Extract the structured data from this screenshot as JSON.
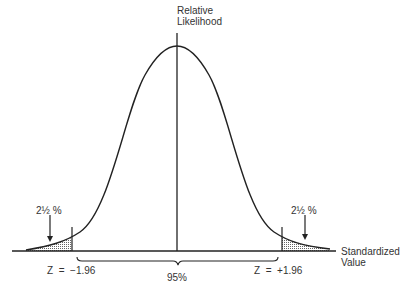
{
  "diagram": {
    "y_axis_label_line1": "Relative",
    "y_axis_label_line2": "Likelihood",
    "x_axis_label_line1": "Standardized",
    "x_axis_label_line2": "Value",
    "left_tail_label": "2½ %",
    "right_tail_label": "2½ %",
    "left_z_label": "Z  =  −1.96",
    "right_z_label": "Z  =  +1.96",
    "center_label": "95%",
    "colors": {
      "line": "#222222",
      "shade": "#888888"
    }
  }
}
